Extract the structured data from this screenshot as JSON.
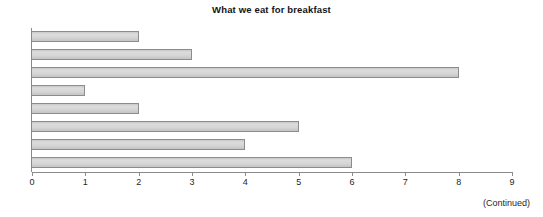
{
  "chart_data": {
    "type": "bar",
    "orientation": "horizontal",
    "title": "What we eat for breakfast",
    "xlabel": "",
    "ylabel": "",
    "xlim": [
      0,
      9
    ],
    "xticks": [
      "0",
      "1",
      "2",
      "3",
      "4",
      "5",
      "6",
      "7",
      "8",
      "9"
    ],
    "categories": [
      "",
      "",
      "",
      "",
      "",
      "",
      "",
      ""
    ],
    "values": [
      2,
      3,
      8,
      1,
      2,
      5,
      4,
      6
    ],
    "grid": false,
    "legend": null,
    "bar_fill_color": "#d2d2d2",
    "bar_edge_color": "#8c8c8c",
    "axis_color": "#8a8a8a"
  },
  "footer": {
    "continued_note": "(Continued)"
  }
}
